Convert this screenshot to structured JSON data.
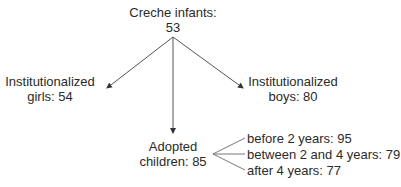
{
  "diagram": {
    "root": {
      "label": "Creche infants:",
      "value": "53"
    },
    "children": [
      {
        "id": "girls",
        "line1": "Institutionalized",
        "line2": "girls: 54"
      },
      {
        "id": "boys",
        "line1": "Institutionalized",
        "line2": "boys: 80"
      },
      {
        "id": "adopted",
        "line1": "Adopted",
        "line2": "children: 85",
        "branches": [
          "before 2 years: 95",
          "between 2 and 4 years: 79",
          "after 4 years: 77"
        ]
      }
    ],
    "colors": {
      "line": "#555555",
      "text": "#2a2a2a"
    }
  }
}
